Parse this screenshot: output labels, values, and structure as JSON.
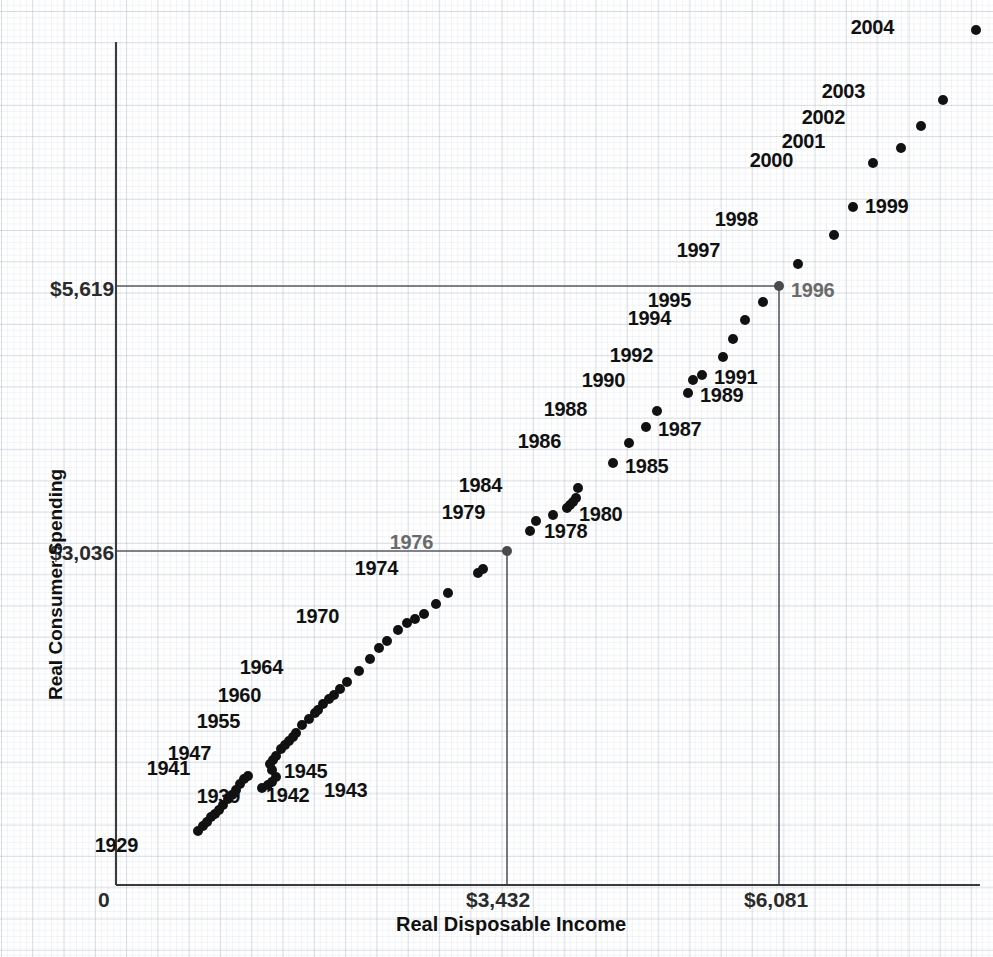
{
  "chart_data": {
    "type": "scatter",
    "title": "",
    "xlabel": "Real Disposable Income",
    "ylabel": "Real Consumer Spending",
    "xlim": [
      0,
      7000
    ],
    "ylim": [
      0,
      7200
    ],
    "grid": true,
    "legend": null,
    "x_ticks": [
      {
        "label": "0",
        "value": 0
      },
      {
        "label": "$3,432",
        "value": 3432
      },
      {
        "label": "$6,081",
        "value": 6081
      }
    ],
    "y_ticks": [
      {
        "label": "$3,036",
        "value": 3036
      },
      {
        "label": "$5,619",
        "value": 5619
      }
    ],
    "reference_lines": [
      {
        "name": "1976-reference",
        "x": 3432,
        "y": 3036,
        "color": "#555a60"
      },
      {
        "name": "1996-reference",
        "x": 6081,
        "y": 5619,
        "color": "#555a60"
      }
    ],
    "points": [
      {
        "year": "1929",
        "x": 1136,
        "y": 1082,
        "px": 198,
        "py": 831,
        "label": "1929",
        "label_dx": -64,
        "label_dy": 14,
        "label_color": "dark"
      },
      {
        "year": "1930",
        "x": 1176,
        "y": 1040,
        "px": 203,
        "py": 826,
        "label": "",
        "label_dx": 0,
        "label_dy": 0,
        "label_color": "dark"
      },
      {
        "year": "1931",
        "x": 1208,
        "y": 1018,
        "px": 207,
        "py": 822,
        "label": "",
        "label_dx": 0,
        "label_dy": 0,
        "label_color": "dark"
      },
      {
        "year": "1932",
        "x": 1240,
        "y": 992,
        "px": 211,
        "py": 817,
        "label": "",
        "label_dx": 0,
        "label_dy": 0,
        "label_color": "dark"
      },
      {
        "year": "1933",
        "x": 1272,
        "y": 1006,
        "px": 215,
        "py": 814,
        "label": "",
        "label_dx": 0,
        "label_dy": 0,
        "label_color": "dark"
      },
      {
        "year": "1934",
        "x": 1320,
        "y": 1042,
        "px": 219,
        "py": 810,
        "label": "",
        "label_dx": 0,
        "label_dy": 0,
        "label_color": "dark"
      },
      {
        "year": "1935",
        "x": 1376,
        "y": 1090,
        "px": 223,
        "py": 805,
        "label": "",
        "label_dx": 0,
        "label_dy": 0,
        "label_color": "dark"
      },
      {
        "year": "1936",
        "x": 1448,
        "y": 1150,
        "px": 228,
        "py": 799,
        "label": "",
        "label_dx": 0,
        "label_dy": 0,
        "label_color": "dark"
      },
      {
        "year": "1937",
        "x": 1496,
        "y": 1190,
        "px": 232,
        "py": 795,
        "label": "",
        "label_dx": 0,
        "label_dy": 0,
        "label_color": "dark"
      },
      {
        "year": "1938",
        "x": 1520,
        "y": 1216,
        "px": 236,
        "py": 790,
        "label": "",
        "label_dx": 0,
        "label_dy": 0,
        "label_color": "dark"
      },
      {
        "year": "1939",
        "x": 1568,
        "y": 1252,
        "px": 240,
        "py": 784,
        "label": "1939",
        "label_dx": -4,
        "label_dy": 12,
        "label_color": "dark"
      },
      {
        "year": "1940",
        "x": 1624,
        "y": 1300,
        "px": 244,
        "py": 779,
        "label": "",
        "label_dx": 0,
        "label_dy": 0,
        "label_color": "dark"
      },
      {
        "year": "1941",
        "x": 1720,
        "y": 1360,
        "px": 248,
        "py": 776,
        "label": "1941",
        "label_dx": -62,
        "label_dy": -8,
        "label_color": "dark"
      },
      {
        "year": "1942",
        "x": 1840,
        "y": 1340,
        "px": 262,
        "py": 788,
        "label": "1942",
        "label_dx": 4,
        "label_dy": 7,
        "label_color": "dark"
      },
      {
        "year": "1943",
        "x": 1900,
        "y": 1380,
        "px": 268,
        "py": 785,
        "label": "1943",
        "label_dx": 56,
        "label_dy": 5,
        "label_color": "dark"
      },
      {
        "year": "1944",
        "x": 1960,
        "y": 1410,
        "px": 272,
        "py": 782,
        "label": "",
        "label_dx": 0,
        "label_dy": 0,
        "label_color": "dark"
      },
      {
        "year": "1945",
        "x": 1976,
        "y": 1470,
        "px": 276,
        "py": 777,
        "label": "1945",
        "label_dx": 8,
        "label_dy": -6,
        "label_color": "dark"
      },
      {
        "year": "1946",
        "x": 1904,
        "y": 1560,
        "px": 272,
        "py": 770,
        "label": "",
        "label_dx": 0,
        "label_dy": 0,
        "label_color": "dark"
      },
      {
        "year": "1947",
        "x": 1880,
        "y": 1600,
        "px": 270,
        "py": 764,
        "label": "1947",
        "label_dx": -63,
        "label_dy": -11,
        "label_color": "dark"
      },
      {
        "year": "1948",
        "x": 1928,
        "y": 1620,
        "px": 273,
        "py": 760,
        "label": "",
        "label_dx": 0,
        "label_dy": 0,
        "label_color": "dark"
      },
      {
        "year": "1949",
        "x": 1936,
        "y": 1650,
        "px": 276,
        "py": 756,
        "label": "",
        "label_dx": 0,
        "label_dy": 0,
        "label_color": "dark"
      },
      {
        "year": "1950",
        "x": 2040,
        "y": 1720,
        "px": 281,
        "py": 749,
        "label": "",
        "label_dx": 0,
        "label_dy": 0,
        "label_color": "dark"
      },
      {
        "year": "1951",
        "x": 2080,
        "y": 1740,
        "px": 285,
        "py": 745,
        "label": "",
        "label_dx": 0,
        "label_dy": 0,
        "label_color": "dark"
      },
      {
        "year": "1952",
        "x": 2136,
        "y": 1780,
        "px": 289,
        "py": 741,
        "label": "",
        "label_dx": 0,
        "label_dy": 0,
        "label_color": "dark"
      },
      {
        "year": "1953",
        "x": 2200,
        "y": 1820,
        "px": 293,
        "py": 737,
        "label": "",
        "label_dx": 0,
        "label_dy": 0,
        "label_color": "dark"
      },
      {
        "year": "1954",
        "x": 2216,
        "y": 1840,
        "px": 296,
        "py": 733,
        "label": "",
        "label_dx": 0,
        "label_dy": 0,
        "label_color": "dark"
      },
      {
        "year": "1955",
        "x": 2320,
        "y": 1940,
        "px": 302,
        "py": 725,
        "label": "1955",
        "label_dx": -66,
        "label_dy": -4,
        "label_color": "dark"
      },
      {
        "year": "1956",
        "x": 2400,
        "y": 1990,
        "px": 309,
        "py": 719,
        "label": "",
        "label_dx": 0,
        "label_dy": 0,
        "label_color": "dark"
      },
      {
        "year": "1957",
        "x": 2424,
        "y": 2010,
        "px": 315,
        "py": 713,
        "label": "",
        "label_dx": 0,
        "label_dy": 0,
        "label_color": "dark"
      },
      {
        "year": "1958",
        "x": 2432,
        "y": 2020,
        "px": 318,
        "py": 710,
        "label": "",
        "label_dx": 0,
        "label_dy": 0,
        "label_color": "dark"
      },
      {
        "year": "1959",
        "x": 2512,
        "y": 2110,
        "px": 323,
        "py": 704,
        "label": "",
        "label_dx": 0,
        "label_dy": 0,
        "label_color": "dark"
      },
      {
        "year": "1960",
        "x": 2552,
        "y": 2150,
        "px": 329,
        "py": 699,
        "label": "1960",
        "label_dx": -72,
        "label_dy": -4,
        "label_color": "dark"
      },
      {
        "year": "1961",
        "x": 2616,
        "y": 2180,
        "px": 334,
        "py": 695,
        "label": "",
        "label_dx": 0,
        "label_dy": 0,
        "label_color": "dark"
      },
      {
        "year": "1962",
        "x": 2712,
        "y": 2250,
        "px": 340,
        "py": 689,
        "label": "",
        "label_dx": 0,
        "label_dy": 0,
        "label_color": "dark"
      },
      {
        "year": "1963",
        "x": 2776,
        "y": 2320,
        "px": 347,
        "py": 682,
        "label": "",
        "label_dx": 0,
        "label_dy": 0,
        "label_color": "dark"
      },
      {
        "year": "1964",
        "x": 2928,
        "y": 2420,
        "px": 359,
        "py": 671,
        "label": "1964",
        "label_dx": -80,
        "label_dy": -4,
        "label_color": "dark"
      },
      {
        "year": "1965",
        "x": 3072,
        "y": 2560,
        "px": 370,
        "py": 659,
        "label": "",
        "label_dx": 0,
        "label_dy": 0,
        "label_color": "dark"
      },
      {
        "year": "1966",
        "x": 3184,
        "y": 2680,
        "px": 379,
        "py": 648,
        "label": "",
        "label_dx": 0,
        "label_dy": 0,
        "label_color": "dark"
      },
      {
        "year": "1967",
        "x": 3288,
        "y": 2740,
        "px": 387,
        "py": 641,
        "label": "",
        "label_dx": 0,
        "label_dy": 0,
        "label_color": "dark"
      },
      {
        "year": "1968",
        "x": 3384,
        "y": 2850,
        "px": 398,
        "py": 630,
        "label": "",
        "label_dx": 0,
        "label_dy": 0,
        "label_color": "dark"
      },
      {
        "year": "1969",
        "x": 3448,
        "y": 2920,
        "px": 407,
        "py": 623,
        "label": "",
        "label_dx": 0,
        "label_dy": 0,
        "label_color": "dark"
      },
      {
        "year": "1970",
        "x": 3560,
        "y": 2960,
        "px": 415,
        "py": 619,
        "label": "1970",
        "label_dx": -80,
        "label_dy": -3,
        "label_color": "dark"
      },
      {
        "year": "1971",
        "x": 3672,
        "y": 3030,
        "px": 424,
        "py": 614,
        "label": "",
        "label_dx": 0,
        "label_dy": 0,
        "label_color": "dark"
      },
      {
        "year": "1972",
        "x": 3800,
        "y": 3160,
        "px": 436,
        "py": 604,
        "label": "",
        "label_dx": 0,
        "label_dy": 0,
        "label_color": "dark"
      },
      {
        "year": "1973",
        "x": 3960,
        "y": 3240,
        "px": 448,
        "py": 593,
        "label": "",
        "label_dx": 0,
        "label_dy": 0,
        "label_color": "dark"
      },
      {
        "year": "1974",
        "x": 4016,
        "y": 3300,
        "px": 478,
        "py": 573,
        "label": "1974",
        "label_dx": -84,
        "label_dy": -5,
        "label_color": "dark"
      },
      {
        "year": "1975",
        "x": 4060,
        "y": 3330,
        "px": 483,
        "py": 569,
        "label": "",
        "label_dx": 0,
        "label_dy": 0,
        "label_color": "dark"
      },
      {
        "year": "1976",
        "x": 3432,
        "y": 3036,
        "px": 507,
        "py": 551,
        "label": "1976",
        "label_dx": -78,
        "label_dy": -9,
        "label_color": "gray"
      },
      {
        "year": "1977",
        "x": 4280,
        "y": 3500,
        "px": 530,
        "py": 531,
        "label": "",
        "label_dx": 0,
        "label_dy": 0,
        "label_color": "dark"
      },
      {
        "year": "1978",
        "x": 4400,
        "y": 3560,
        "px": 536,
        "py": 521,
        "label": "1978",
        "label_dx": 8,
        "label_dy": 10,
        "label_color": "dark"
      },
      {
        "year": "1979",
        "x": 4480,
        "y": 3600,
        "px": 553,
        "py": 515,
        "label": "1979",
        "label_dx": -72,
        "label_dy": -3,
        "label_color": "dark"
      },
      {
        "year": "1980",
        "x": 4512,
        "y": 3620,
        "px": 567,
        "py": 508,
        "label": "1980",
        "label_dx": 12,
        "label_dy": 6,
        "label_color": "dark"
      },
      {
        "year": "1981",
        "x": 4560,
        "y": 3660,
        "px": 570,
        "py": 505,
        "label": "",
        "label_dx": 0,
        "label_dy": 0,
        "label_color": "dark"
      },
      {
        "year": "1982",
        "x": 4600,
        "y": 3700,
        "px": 573,
        "py": 502,
        "label": "",
        "label_dx": 0,
        "label_dy": 0,
        "label_color": "dark"
      },
      {
        "year": "1983",
        "x": 4680,
        "y": 3780,
        "px": 576,
        "py": 498,
        "label": "",
        "label_dx": 0,
        "label_dy": 0,
        "label_color": "dark"
      },
      {
        "year": "1984",
        "x": 4900,
        "y": 3900,
        "px": 578,
        "py": 488,
        "label": "1984",
        "label_dx": -80,
        "label_dy": -3,
        "label_color": "dark"
      },
      {
        "year": "1985",
        "x": 5040,
        "y": 4080,
        "px": 613,
        "py": 463,
        "label": "1985",
        "label_dx": 12,
        "label_dy": 3,
        "label_color": "dark"
      },
      {
        "year": "1986",
        "x": 5160,
        "y": 4200,
        "px": 629,
        "py": 443,
        "label": "1986",
        "label_dx": -72,
        "label_dy": -2,
        "label_color": "dark"
      },
      {
        "year": "1987",
        "x": 5280,
        "y": 4320,
        "px": 646,
        "py": 427,
        "label": "1987",
        "label_dx": 12,
        "label_dy": 2,
        "label_color": "dark"
      },
      {
        "year": "1988",
        "x": 5400,
        "y": 4440,
        "px": 657,
        "py": 411,
        "label": "1988",
        "label_dx": -74,
        "label_dy": -2,
        "label_color": "dark"
      },
      {
        "year": "1989",
        "x": 5480,
        "y": 4540,
        "px": 688,
        "py": 393,
        "label": "1989",
        "label_dx": 12,
        "label_dy": 2,
        "label_color": "dark"
      },
      {
        "year": "1990",
        "x": 5560,
        "y": 4600,
        "px": 693,
        "py": 380,
        "label": "1990",
        "label_dx": -72,
        "label_dy": 0,
        "label_color": "dark"
      },
      {
        "year": "1991",
        "x": 5560,
        "y": 4600,
        "px": 702,
        "py": 375,
        "label": "1991",
        "label_dx": 12,
        "label_dy": 2,
        "label_color": "dark"
      },
      {
        "year": "1992",
        "x": 5720,
        "y": 4720,
        "px": 723,
        "py": 357,
        "label": "1992",
        "label_dx": -74,
        "label_dy": -2,
        "label_color": "dark"
      },
      {
        "year": "1993",
        "x": 5800,
        "y": 4840,
        "px": 733,
        "py": 339,
        "label": "",
        "label_dx": 0,
        "label_dy": 0,
        "label_color": "dark"
      },
      {
        "year": "1994",
        "x": 5920,
        "y": 4960,
        "px": 745,
        "py": 320,
        "label": "1994",
        "label_dx": -78,
        "label_dy": -2,
        "label_color": "dark"
      },
      {
        "year": "1995",
        "x": 6000,
        "y": 5080,
        "px": 763,
        "py": 302,
        "label": "1995",
        "label_dx": -76,
        "label_dy": -2,
        "label_color": "dark"
      },
      {
        "year": "1996",
        "x": 6081,
        "y": 5619,
        "px": 779,
        "py": 286,
        "label": "1996",
        "label_dx": 12,
        "label_dy": 4,
        "label_color": "gray"
      },
      {
        "year": "1997",
        "x": 6360,
        "y": 5400,
        "px": 798,
        "py": 264,
        "label": "1997",
        "label_dx": -82,
        "label_dy": -14,
        "label_color": "dark"
      },
      {
        "year": "1998",
        "x": 6560,
        "y": 5600,
        "px": 834,
        "py": 235,
        "label": "1998",
        "label_dx": -80,
        "label_dy": -16,
        "label_color": "dark"
      },
      {
        "year": "1999",
        "x": 6720,
        "y": 5800,
        "px": 853,
        "py": 207,
        "label": "1999",
        "label_dx": 12,
        "label_dy": -1,
        "label_color": "dark"
      },
      {
        "year": "2000",
        "x": 6880,
        "y": 6000,
        "px": 873,
        "py": 163,
        "label": "2000",
        "label_dx": -84,
        "label_dy": -3,
        "label_color": "dark"
      },
      {
        "year": "2001",
        "x": 6960,
        "y": 6120,
        "px": 901,
        "py": 148,
        "label": "2001",
        "label_dx": -80,
        "label_dy": -7,
        "label_color": "dark"
      },
      {
        "year": "2002",
        "x": 7040,
        "y": 6240,
        "px": 921,
        "py": 126,
        "label": "2002",
        "label_dx": -80,
        "label_dy": -9,
        "label_color": "dark"
      },
      {
        "year": "2003",
        "x": 7160,
        "y": 6400,
        "px": 943,
        "py": 100,
        "label": "2003",
        "label_dx": -82,
        "label_dy": -9,
        "label_color": "dark"
      },
      {
        "year": "2004",
        "x": 7320,
        "y": 6620,
        "px": 976,
        "py": 30,
        "label": "2004",
        "label_dx": -86,
        "label_dy": -3,
        "label_color": "dark"
      }
    ]
  }
}
